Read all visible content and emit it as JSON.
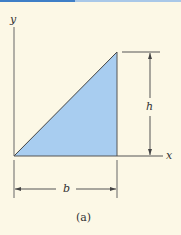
{
  "figure": {
    "caption": "(a)",
    "labels": {
      "x_axis": "x",
      "y_axis": "y",
      "height": "h",
      "base": "b"
    },
    "colors": {
      "background": "#fcf8e6",
      "fill": "#a8cdf0",
      "line": "#444444",
      "topbar": "#3f7fc7"
    },
    "shape": "right triangle with base b along x-axis and height h at right edge"
  }
}
